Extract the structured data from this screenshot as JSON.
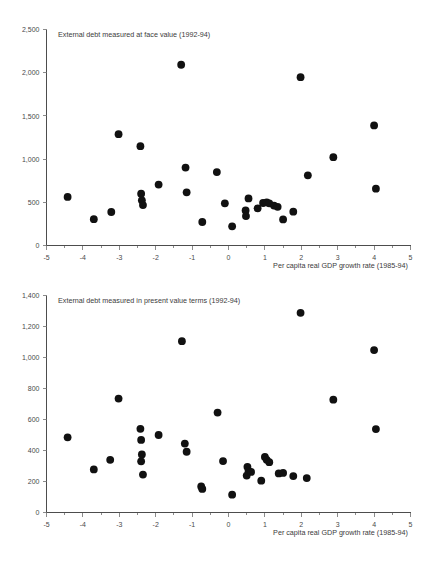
{
  "document": {
    "kind": "scatter-plot-figure-pair",
    "background_color": "#ffffff",
    "marker_color": "#111111",
    "axis_color": "#4d4d4d",
    "text_color": "#3b3b3b"
  },
  "charts": [
    {
      "id": "face-value",
      "title": "External debt measured at face value (1992-94)",
      "xlabel": "Per capita real GDP growth rate (1985-94)"
    },
    {
      "id": "present-value",
      "title": "External debt measured in present value terms (1992-94)",
      "xlabel": "Per capita real GDP growth rate (1985-94)"
    }
  ],
  "chart_data": [
    {
      "type": "scatter",
      "title": "External debt measured at face value (1992-94)",
      "xlabel": "Per capita real GDP growth rate (1985-94)",
      "ylabel": "",
      "xlim": [
        -5,
        5
      ],
      "ylim": [
        0,
        2500
      ],
      "xticks": [
        -5,
        -4,
        -3,
        -2,
        -1,
        0,
        1,
        2,
        3,
        4,
        5
      ],
      "xticklabels": [
        "-5",
        "-4",
        "-3",
        "-2",
        "-1",
        "0",
        "1",
        "2",
        "3",
        "4",
        "5"
      ],
      "yticks": [
        0,
        500,
        1000,
        1500,
        2000,
        2500
      ],
      "yticklabels": [
        "0",
        "500",
        "1,000",
        "1,500",
        "2,000",
        "2,500"
      ],
      "grid": false,
      "legend": null,
      "points": [
        [
          -4.42,
          562
        ],
        [
          -3.7,
          305
        ],
        [
          -3.22,
          388
        ],
        [
          -3.02,
          1288
        ],
        [
          -2.42,
          1150
        ],
        [
          -2.4,
          600
        ],
        [
          -2.38,
          523
        ],
        [
          -2.35,
          468
        ],
        [
          -1.92,
          705
        ],
        [
          -1.3,
          2092
        ],
        [
          -1.18,
          902
        ],
        [
          -1.15,
          615
        ],
        [
          -0.72,
          272
        ],
        [
          -0.32,
          850
        ],
        [
          -0.1,
          488
        ],
        [
          0.1,
          222
        ],
        [
          0.47,
          405
        ],
        [
          0.48,
          340
        ],
        [
          0.55,
          545
        ],
        [
          0.8,
          430
        ],
        [
          0.95,
          492
        ],
        [
          1.05,
          500
        ],
        [
          1.12,
          488
        ],
        [
          1.25,
          462
        ],
        [
          1.35,
          448
        ],
        [
          1.5,
          302
        ],
        [
          1.78,
          392
        ],
        [
          1.98,
          1948
        ],
        [
          2.18,
          812
        ],
        [
          2.88,
          1022
        ],
        [
          4.0,
          1390
        ],
        [
          4.05,
          658
        ]
      ]
    },
    {
      "type": "scatter",
      "title": "External debt measured in present value terms (1992-94)",
      "xlabel": "Per capita real GDP growth rate (1985-94)",
      "ylabel": "",
      "xlim": [
        -5,
        5
      ],
      "ylim": [
        0,
        1400
      ],
      "xticks": [
        -5,
        -4,
        -3,
        -2,
        -1,
        0,
        1,
        2,
        3,
        4,
        5
      ],
      "xticklabels": [
        "-5",
        "-4",
        "-3",
        "-2",
        "-1",
        "0",
        "1",
        "2",
        "3",
        "4",
        "5"
      ],
      "yticks": [
        0,
        200,
        400,
        600,
        800,
        1000,
        1200,
        1400
      ],
      "yticklabels": [
        "0",
        "200",
        "400",
        "600",
        "800",
        "1,000",
        "1,200",
        "1,400"
      ],
      "grid": false,
      "legend": null,
      "points": [
        [
          -4.42,
          485
        ],
        [
          -3.7,
          278
        ],
        [
          -3.25,
          340
        ],
        [
          -3.02,
          735
        ],
        [
          -2.42,
          540
        ],
        [
          -2.4,
          468
        ],
        [
          -2.38,
          375
        ],
        [
          -2.4,
          330
        ],
        [
          -2.35,
          245
        ],
        [
          -1.92,
          500
        ],
        [
          -1.28,
          1105
        ],
        [
          -1.2,
          445
        ],
        [
          -1.15,
          392
        ],
        [
          -0.75,
          168
        ],
        [
          -0.72,
          152
        ],
        [
          -0.3,
          645
        ],
        [
          -0.15,
          332
        ],
        [
          0.1,
          115
        ],
        [
          0.52,
          295
        ],
        [
          0.55,
          268
        ],
        [
          0.5,
          238
        ],
        [
          0.62,
          262
        ],
        [
          0.9,
          205
        ],
        [
          1.0,
          358
        ],
        [
          1.05,
          340
        ],
        [
          1.12,
          325
        ],
        [
          1.38,
          252
        ],
        [
          1.5,
          255
        ],
        [
          1.78,
          235
        ],
        [
          2.15,
          222
        ],
        [
          1.98,
          1288
        ],
        [
          2.88,
          728
        ],
        [
          4.0,
          1048
        ],
        [
          4.05,
          538
        ]
      ]
    }
  ]
}
